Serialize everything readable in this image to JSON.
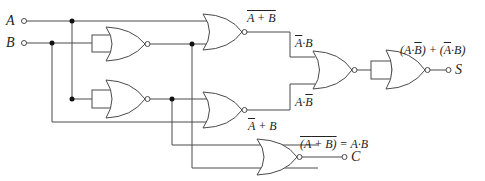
{
  "inputs": [
    {
      "name": "A"
    },
    {
      "name": "B"
    }
  ],
  "outputs": [
    {
      "name": "S"
    },
    {
      "name": "C"
    }
  ],
  "labels": {
    "nor_top_out_bar": "A + B",
    "top_and": {
      "a": "A",
      "dot": "·",
      "b": "B"
    },
    "mid_and": {
      "a": "A",
      "dot": "·",
      "b": "B"
    },
    "nor_mid_out": {
      "a": "A",
      "op": " + ",
      "b": "B"
    },
    "sum_expr": {
      "p1": "(A·",
      "b1": "B",
      "p2": ") + (",
      "a2": "A",
      "p3": "·B)"
    },
    "carry_expr": {
      "open": "(",
      "a": "A",
      "op": " + ",
      "b": "B",
      "close": ")",
      "eq": " = A·B"
    }
  },
  "colors": {
    "wire": "#4a4a4a",
    "junction": "#111111",
    "text": "#222222",
    "background": "#ffffff"
  }
}
